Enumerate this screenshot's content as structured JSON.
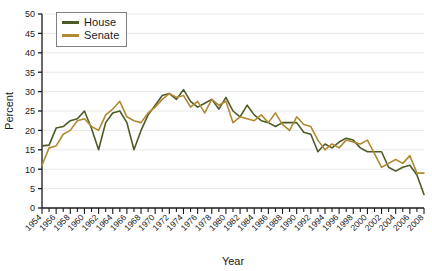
{
  "chart_data": {
    "type": "line",
    "title": "",
    "xlabel": "Year",
    "ylabel": "Percent",
    "xlim": [
      1954,
      2008
    ],
    "ylim": [
      0,
      50
    ],
    "ytick_step": 5,
    "xtick_step": 2,
    "xminor_step": 1,
    "grid": true,
    "legend_position": "top-left",
    "colors": {
      "house": "#4c5a26",
      "senate": "#b08a33",
      "axis": "#1a1a1a",
      "grid": "#e8e8e8",
      "legend_border": "#808080",
      "background": "#ffffff"
    },
    "yticks": [
      0,
      5,
      10,
      15,
      20,
      25,
      30,
      35,
      40,
      45,
      50
    ],
    "xticks": [
      1954,
      1956,
      1958,
      1960,
      1962,
      1964,
      1966,
      1968,
      1970,
      1972,
      1974,
      1976,
      1978,
      1980,
      1982,
      1984,
      1986,
      1988,
      1990,
      1992,
      1994,
      1996,
      1998,
      2000,
      2002,
      2004,
      2006,
      2008
    ],
    "x": [
      1954,
      1955,
      1956,
      1957,
      1958,
      1959,
      1960,
      1961,
      1962,
      1963,
      1964,
      1965,
      1966,
      1967,
      1968,
      1969,
      1970,
      1971,
      1972,
      1973,
      1974,
      1975,
      1976,
      1977,
      1978,
      1979,
      1980,
      1981,
      1982,
      1983,
      1984,
      1985,
      1986,
      1987,
      1988,
      1989,
      1990,
      1991,
      1992,
      1993,
      1994,
      1995,
      1996,
      1997,
      1998,
      1999,
      2000,
      2001,
      2002,
      2003,
      2004,
      2005,
      2006,
      2007,
      2008
    ],
    "series": [
      {
        "name": "House",
        "color": "#4c5a26",
        "values": [
          16.0,
          16.2,
          20.6,
          21.0,
          22.5,
          23.0,
          25.0,
          20.5,
          15.0,
          22.0,
          24.5,
          25.0,
          22.0,
          15.0,
          20.0,
          24.0,
          26.5,
          29.0,
          29.5,
          28.0,
          30.5,
          27.5,
          26.0,
          27.0,
          28.0,
          25.5,
          28.5,
          25.0,
          23.5,
          26.5,
          24.0,
          22.5,
          22.0,
          21.0,
          22.0,
          22.0,
          22.0,
          19.5,
          19.0,
          14.5,
          16.5,
          15.5,
          17.0,
          18.0,
          17.5,
          15.5,
          14.5,
          14.5,
          14.5,
          10.5,
          9.5,
          10.5,
          11.0,
          8.5,
          3.5
        ]
      },
      {
        "name": "Senate",
        "color": "#b08a33",
        "values": [
          11.0,
          15.5,
          16.0,
          19.0,
          20.0,
          22.5,
          23.0,
          21.0,
          20.0,
          24.0,
          25.5,
          27.5,
          23.5,
          22.5,
          22.0,
          24.5,
          26.0,
          28.0,
          29.5,
          28.5,
          29.0,
          26.0,
          27.5,
          24.5,
          28.0,
          26.5,
          27.5,
          22.0,
          23.5,
          23.0,
          22.5,
          24.0,
          22.0,
          24.5,
          21.5,
          20.0,
          23.5,
          21.5,
          21.0,
          17.5,
          15.0,
          16.5,
          15.5,
          17.5,
          17.0,
          16.5,
          17.5,
          14.0,
          10.5,
          11.5,
          12.5,
          11.5,
          13.5,
          9.0,
          9.0
        ]
      }
    ]
  },
  "legend": {
    "items": [
      {
        "label": "House",
        "color": "#4c5a26"
      },
      {
        "label": "Senate",
        "color": "#b08a33"
      }
    ]
  },
  "axes": {
    "x_title": "Year",
    "y_title": "Percent"
  }
}
